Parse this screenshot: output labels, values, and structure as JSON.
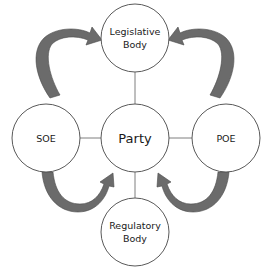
{
  "diagram": {
    "type": "influence-network",
    "nodes": {
      "legislative": {
        "line1": "Legislative",
        "line2": "Body"
      },
      "party": {
        "label": "Party"
      },
      "soe": {
        "label": "SOE"
      },
      "poe": {
        "label": "POE"
      },
      "regulatory": {
        "line1": "Regulatory",
        "line2": "Body"
      }
    },
    "edges": [
      {
        "from": "Party",
        "to": "Legislative Body",
        "kind": "line"
      },
      {
        "from": "Party",
        "to": "SOE",
        "kind": "line"
      },
      {
        "from": "Party",
        "to": "POE",
        "kind": "line"
      },
      {
        "from": "Party",
        "to": "Regulatory Body",
        "kind": "line"
      },
      {
        "from": "SOE",
        "to": "Legislative Body",
        "kind": "curved-arrow"
      },
      {
        "from": "POE",
        "to": "Legislative Body",
        "kind": "curved-arrow"
      },
      {
        "from": "SOE",
        "to": "Party",
        "kind": "curved-arrow"
      },
      {
        "from": "POE",
        "to": "Party",
        "kind": "curved-arrow"
      }
    ],
    "colors": {
      "arrow_fill": "#6b6b6b",
      "arrow_stroke": "#4a4a4a",
      "circle_stroke": "#595959",
      "connector": "#7f7f7f"
    }
  }
}
